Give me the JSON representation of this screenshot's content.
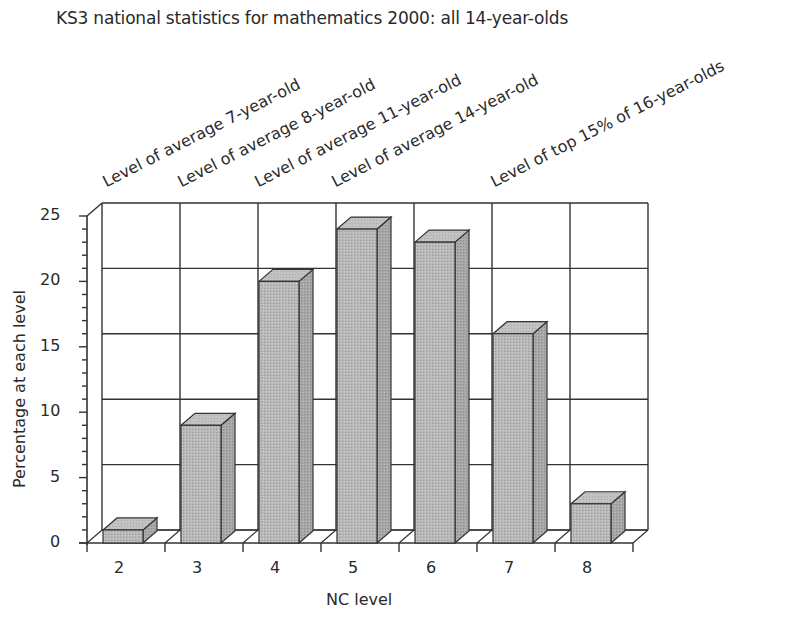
{
  "chart_data": {
    "type": "bar",
    "style": "3d-column",
    "title": "KS3 national statistics for mathematics 2000: all 14-year-olds",
    "xlabel": "NC level",
    "ylabel": "Percentage at each level",
    "categories": [
      "2",
      "3",
      "4",
      "5",
      "6",
      "7",
      "8"
    ],
    "values": [
      1,
      9,
      20,
      24,
      23,
      16,
      3
    ],
    "ylim": [
      0,
      25
    ],
    "yticks": [
      0,
      5,
      10,
      15,
      20,
      25
    ],
    "minor_tick_step": 1,
    "grid": true,
    "legend": null,
    "annotations": [
      {
        "text": "Level of average 7-year-old",
        "category": "2"
      },
      {
        "text": "Level of average 8-year-old",
        "category": "3"
      },
      {
        "text": "Level of average 11-year-old",
        "category": "4"
      },
      {
        "text": "Level of average 14-year-old",
        "category": "5"
      },
      {
        "text": "Level of top 15% of 16-year-olds",
        "category": "7"
      }
    ],
    "colors": {
      "bar_front": "#b4b4b4",
      "bar_side": "#a2a2a2",
      "bar_top": "#c4c4c4",
      "line": "#333333"
    }
  }
}
